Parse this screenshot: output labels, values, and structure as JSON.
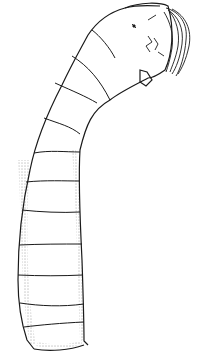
{
  "figure": {
    "subject": "Larva illustration (segmented body, curved head with bristles)",
    "background_color": "#ffffff",
    "ink_color": "#1a1a1a",
    "segments_count": 12
  }
}
